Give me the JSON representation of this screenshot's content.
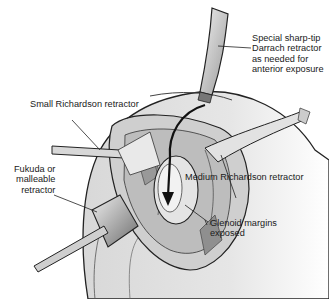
{
  "figure": {
    "labels": {
      "darrach": "Special sharp-tip\nDarrach retractor\nas needed for\nanterior exposure",
      "small_richardson": "Small Richardson retractor",
      "medium_richardson": "Medium Richardson retractor",
      "fukuda": "Fukuda or\nmalleable\nretractor",
      "glenoid": "Glenoid margins\nexposed"
    }
  }
}
